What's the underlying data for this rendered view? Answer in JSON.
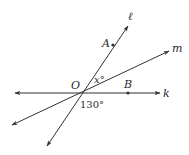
{
  "diagram": {
    "type": "intersecting-lines",
    "stroke_color": "#333333",
    "background": "#ffffff",
    "center": {
      "name": "O",
      "x": 82,
      "y": 93
    },
    "lines": [
      {
        "name": "k",
        "label": "k",
        "from": [
          15,
          93
        ],
        "to": [
          160,
          93
        ],
        "arrows": "both",
        "label_pos": [
          163,
          97
        ]
      },
      {
        "name": "m",
        "label": "m",
        "from": [
          12,
          125
        ],
        "to": [
          169,
          51
        ],
        "arrows": "both",
        "label_pos": [
          172,
          52
        ]
      },
      {
        "name": "l",
        "label": "ℓ",
        "from": [
          47,
          146
        ],
        "to": [
          128,
          26
        ],
        "arrows": "both",
        "label_pos": [
          128,
          20
        ]
      }
    ],
    "points": [
      {
        "name": "A",
        "label": "A",
        "x": 113,
        "y": 45,
        "label_pos": [
          102,
          47
        ]
      },
      {
        "name": "B",
        "label": "B",
        "x": 128,
        "y": 93,
        "label_pos": [
          124,
          88
        ]
      },
      {
        "name": "O",
        "label": "O",
        "label_pos": [
          71,
          89
        ]
      }
    ],
    "angles": [
      {
        "label": "x°",
        "between": [
          "l",
          "m"
        ],
        "label_pos": [
          94,
          83
        ]
      },
      {
        "label": "130°",
        "label_pos": [
          80,
          108
        ]
      }
    ]
  }
}
